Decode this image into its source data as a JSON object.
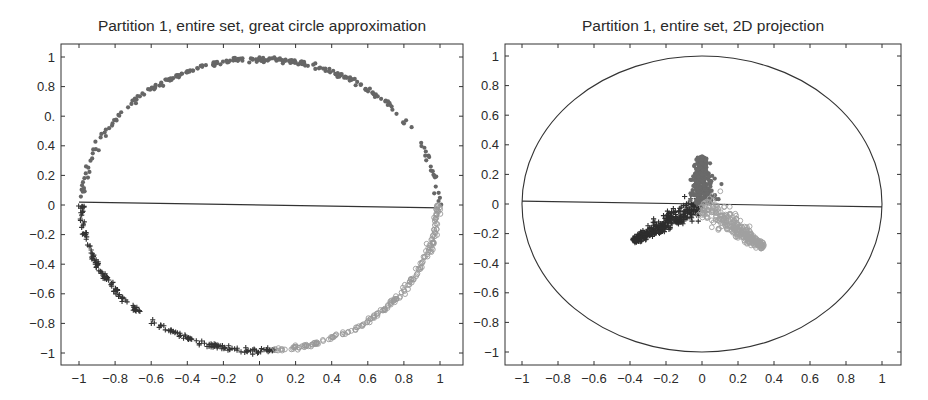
{
  "chart_data": [
    {
      "type": "scatter",
      "title": "Partition 1, entire set, great circle approximation",
      "xlabel": "",
      "ylabel": "",
      "xlim": [
        -1.1,
        1.1
      ],
      "ylim": [
        -1.1,
        1.1
      ],
      "x_ticks": [
        "-1",
        "-0.8",
        "-0.6",
        "-0.4",
        "-0.2",
        "0",
        "0.2",
        "0.4",
        "0.6",
        "0.8",
        "1"
      ],
      "y_ticks": [
        "1",
        "0.8",
        "0.",
        "0.4",
        "0.2",
        "0",
        "-0.2",
        "-0.4",
        "-0.6",
        "-0.8",
        "-1"
      ],
      "grid": false,
      "legend": null,
      "reference_line": {
        "from": [
          -1,
          0.02
        ],
        "to": [
          1,
          -0.02
        ]
      },
      "series": [
        {
          "name": "class A (dark plus)",
          "marker": "+",
          "color": "#333333",
          "description": "points along lower-left arc of unit circle",
          "angle_range_deg": [
            180,
            275
          ]
        },
        {
          "name": "class B (medium dot)",
          "marker": "*",
          "color": "#666666",
          "description": "points along upper arc of unit circle",
          "angle_range_deg": [
            0,
            180
          ]
        },
        {
          "name": "class C (light circle)",
          "marker": "o",
          "color": "#9a9a9a",
          "description": "points along lower-right arc of unit circle",
          "angle_range_deg": [
            275,
            360
          ]
        }
      ]
    },
    {
      "type": "scatter",
      "title": "Partition 1, entire set, 2D projection",
      "xlabel": "",
      "ylabel": "",
      "xlim": [
        -1.1,
        1.1
      ],
      "ylim": [
        -1.1,
        1.1
      ],
      "x_ticks": [
        "-1",
        "-0.8",
        "-0.6",
        "-0.4",
        "-0.2",
        "0",
        "0.2",
        "0.4",
        "0.6",
        "0.8",
        "1"
      ],
      "y_ticks": [
        "1",
        "0.8",
        "0.6",
        "0.4",
        "0.2",
        "0",
        "-0.2",
        "-0.4",
        "-0.6",
        "-0.8",
        "-1"
      ],
      "grid": false,
      "legend": null,
      "unit_circle": true,
      "reference_line": {
        "from": [
          -1,
          0.02
        ],
        "to": [
          1,
          -0.02
        ]
      },
      "series": [
        {
          "name": "class A (dark plus)",
          "marker": "+",
          "color": "#2e2e2e",
          "description": "arm extending lower-left",
          "tip": [
            -0.38,
            -0.25
          ],
          "base": [
            0,
            0
          ]
        },
        {
          "name": "class B (medium dot)",
          "marker": "*",
          "color": "#6a6a6a",
          "description": "arm extending upward",
          "tip": [
            0.0,
            0.32
          ],
          "base": [
            0,
            0
          ]
        },
        {
          "name": "class C (light circle)",
          "marker": "o",
          "color": "#a0a0a0",
          "description": "arm extending lower-right",
          "tip": [
            0.34,
            -0.29
          ],
          "base": [
            0,
            0
          ]
        }
      ]
    }
  ],
  "left": {
    "title": "Partition 1, entire set, great circle approximation"
  },
  "right": {
    "title": "Partition 1, entire set, 2D projection"
  }
}
